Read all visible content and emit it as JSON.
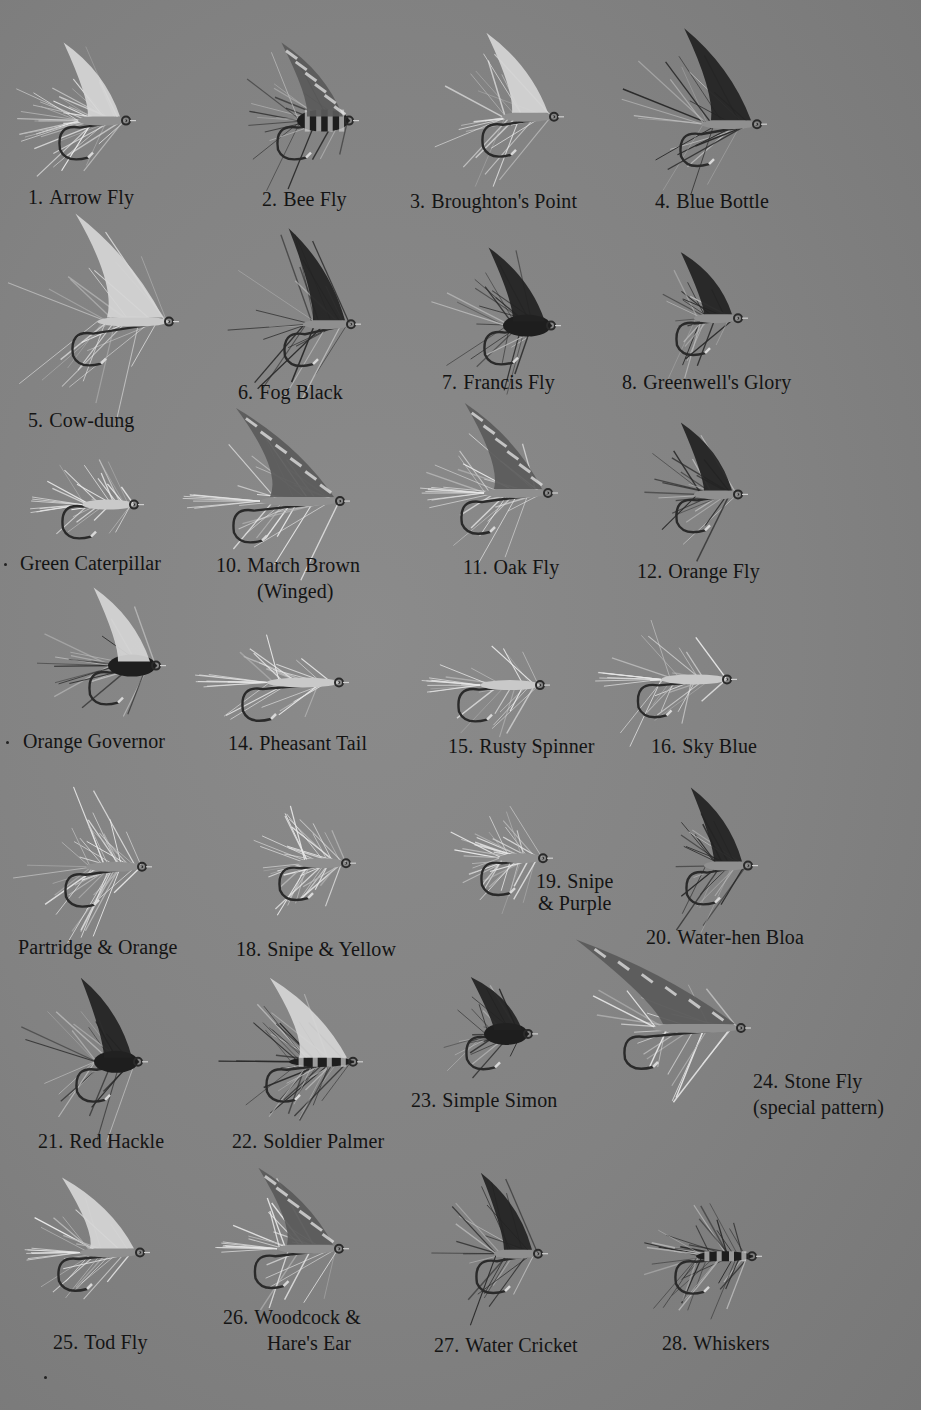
{
  "plate": {
    "background": "#858585",
    "border_color": "#ffffff",
    "text_color": "#141414"
  },
  "flies": [
    {
      "num": "1.",
      "name": "Arrow Fly",
      "style": "spiky-pale"
    },
    {
      "num": "2.",
      "name": "Bee Fly",
      "style": "barred-wing-dark-body"
    },
    {
      "num": "3.",
      "name": "Broughton's Point",
      "style": "winged-hook"
    },
    {
      "num": "4.",
      "name": "Blue Bottle",
      "style": "dark-hackle"
    },
    {
      "num": "5.",
      "name": "Cow-dung",
      "style": "pale-wing-fuzzy"
    },
    {
      "num": "6.",
      "name": "Fog Black",
      "style": "dark-wing"
    },
    {
      "num": "7.",
      "name": "Francis Fly",
      "style": "dark-body-wing"
    },
    {
      "num": "8.",
      "name": "Greenwell's Glory",
      "style": "dark-wing"
    },
    {
      "num": "",
      "name": "Green Caterpillar",
      "style": "caterpillar"
    },
    {
      "num": "10.",
      "name": "March Brown",
      "name2": "(Winged)",
      "style": "mottled-wing"
    },
    {
      "num": "11.",
      "name": "Oak Fly",
      "style": "mottled-wing"
    },
    {
      "num": "12.",
      "name": "Orange Fly",
      "style": "dark-wing"
    },
    {
      "num": "",
      "name": "Orange Governor",
      "style": "pale-wing-dark-body"
    },
    {
      "num": "14.",
      "name": "Pheasant Tail",
      "style": "tail-hackle"
    },
    {
      "num": "15.",
      "name": "Rusty Spinner",
      "style": "tail-hackle"
    },
    {
      "num": "16.",
      "name": "Sky Blue",
      "style": "tail-hackle"
    },
    {
      "num": "",
      "name": "Partridge & Orange",
      "style": "spiky-pale"
    },
    {
      "num": "18.",
      "name": "Snipe & Yellow",
      "style": "spiky-pale"
    },
    {
      "num": "19.",
      "name": "Snipe",
      "name2": "& Purple",
      "style": "spiky-pale"
    },
    {
      "num": "20.",
      "name": "Water-hen Bloa",
      "style": "dark-hackle"
    },
    {
      "num": "21.",
      "name": "Red Hackle",
      "style": "dark-body-hackle"
    },
    {
      "num": "22.",
      "name": "Soldier Palmer",
      "style": "palmer"
    },
    {
      "num": "23.",
      "name": "Simple Simon",
      "style": "dark-body-hackle"
    },
    {
      "num": "24.",
      "name": "Stone Fly",
      "name2": "(special pattern)",
      "style": "long-wing"
    },
    {
      "num": "25.",
      "name": "Tod Fly",
      "style": "pale-wing"
    },
    {
      "num": "26.",
      "name": "Woodcock &",
      "name2": "Hare's Ear",
      "style": "mottled-wing"
    },
    {
      "num": "27.",
      "name": "Water Cricket",
      "style": "dark-hackle"
    },
    {
      "num": "28.",
      "name": "Whiskers",
      "style": "palmer"
    }
  ]
}
